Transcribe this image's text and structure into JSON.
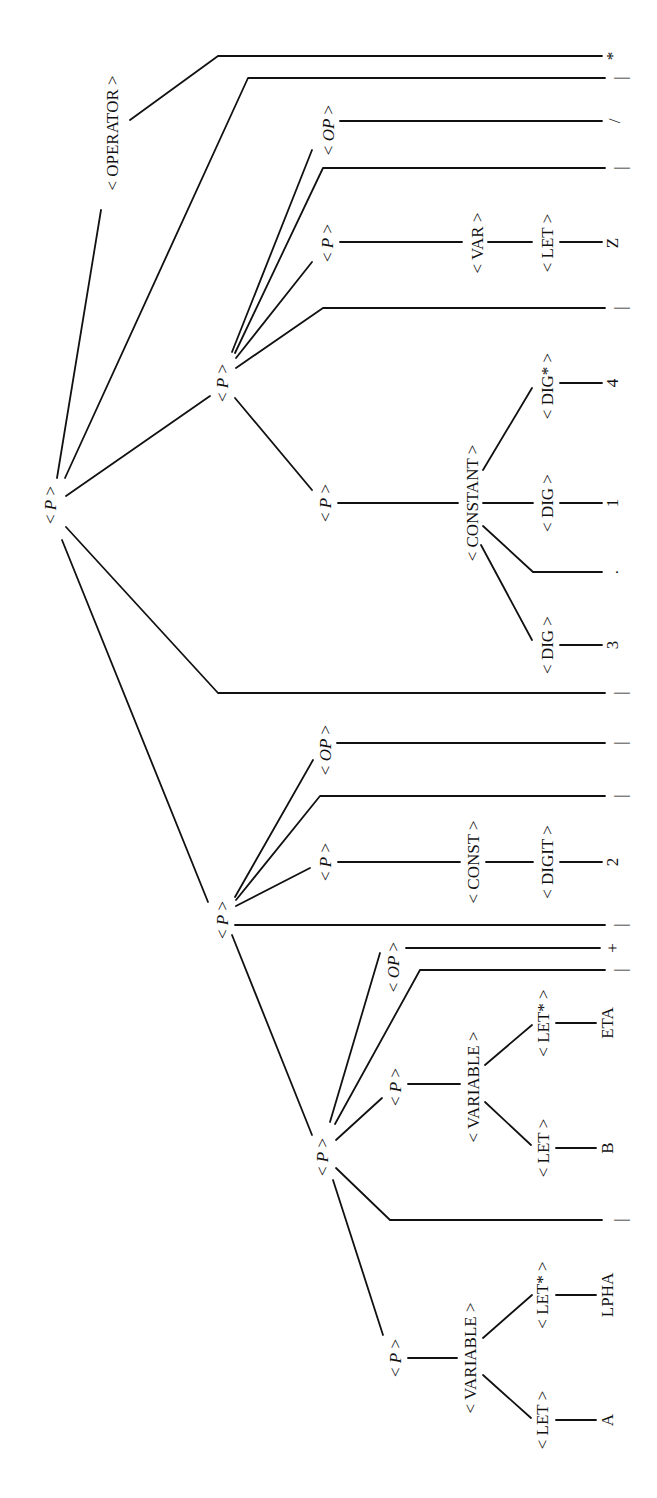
{
  "diagram": {
    "type": "parse-tree",
    "orientation": "rotated-90-ccw",
    "line_color": "#111111",
    "background": "#ffffff",
    "nodes": [
      {
        "id": "root",
        "label": "< P >",
        "italic_P": true,
        "x": 50,
        "y": 505
      },
      {
        "id": "operator",
        "label": "< OPERATOR >",
        "x": 112,
        "y": 133
      },
      {
        "id": "p_upper",
        "label": "< P >",
        "italic_P": true,
        "x": 222,
        "y": 383
      },
      {
        "id": "op_div",
        "label": "< OP >",
        "italic_P": true,
        "x": 328,
        "y": 130
      },
      {
        "id": "p_z",
        "label": "< P >",
        "italic_P": true,
        "x": 327,
        "y": 243
      },
      {
        "id": "var_z",
        "label": "< VAR >",
        "x": 477,
        "y": 243
      },
      {
        "id": "let_z",
        "label": "< LET >",
        "x": 547,
        "y": 243
      },
      {
        "id": "p_const",
        "label": "< P >",
        "italic_P": true,
        "x": 325,
        "y": 503
      },
      {
        "id": "constant",
        "label": "< CONSTANT >",
        "x": 472,
        "y": 503
      },
      {
        "id": "digstar",
        "label": "< DIG* >",
        "x": 547,
        "y": 386
      },
      {
        "id": "dig_1",
        "label": "< DIG >",
        "x": 547,
        "y": 503
      },
      {
        "id": "dig_3",
        "label": "< DIG >",
        "x": 547,
        "y": 645
      },
      {
        "id": "p_mid",
        "label": "< P >",
        "italic_P": true,
        "x": 222,
        "y": 920
      },
      {
        "id": "op_mid",
        "label": "< OP >",
        "italic_P": true,
        "x": 325,
        "y": 750
      },
      {
        "id": "p_2",
        "label": "< P >",
        "italic_P": true,
        "x": 325,
        "y": 862
      },
      {
        "id": "const_2",
        "label": "< CONST >",
        "x": 473,
        "y": 862
      },
      {
        "id": "digit_2",
        "label": "< DIGIT >",
        "x": 547,
        "y": 862
      },
      {
        "id": "p_lower",
        "label": "< P >",
        "italic_P": true,
        "x": 322,
        "y": 1157
      },
      {
        "id": "op_plus",
        "label": "< OP >",
        "italic_P": true,
        "x": 393,
        "y": 967
      },
      {
        "id": "p_b",
        "label": "< P >",
        "italic_P": true,
        "x": 395,
        "y": 1087
      },
      {
        "id": "variable_b",
        "label": "< VARIABLE >",
        "x": 473,
        "y": 1087
      },
      {
        "id": "letstar_b",
        "label": "< LET* >",
        "x": 543,
        "y": 1023
      },
      {
        "id": "let_b",
        "label": "< LET >",
        "x": 543,
        "y": 1148
      },
      {
        "id": "p_a",
        "label": "< P >",
        "italic_P": true,
        "x": 395,
        "y": 1358
      },
      {
        "id": "variable_a",
        "label": "< VARIABLE >",
        "x": 470,
        "y": 1358
      },
      {
        "id": "letstar_a",
        "label": "< LET* >",
        "x": 542,
        "y": 1295
      },
      {
        "id": "let_a",
        "label": "< LET >",
        "x": 542,
        "y": 1420
      }
    ],
    "leaves": [
      {
        "id": "leaf_star",
        "text": "*",
        "x": 612,
        "y": 56
      },
      {
        "id": "leaf_bar1",
        "text": "|",
        "x": 620,
        "y": 78
      },
      {
        "id": "leaf_slash",
        "text": "/",
        "x": 614,
        "y": 121
      },
      {
        "id": "leaf_bar2",
        "text": "|",
        "x": 620,
        "y": 168
      },
      {
        "id": "leaf_z",
        "text": "Z",
        "x": 612,
        "y": 243
      },
      {
        "id": "leaf_bar3",
        "text": "|",
        "x": 620,
        "y": 308
      },
      {
        "id": "leaf_4",
        "text": "4",
        "x": 612,
        "y": 383
      },
      {
        "id": "leaf_1",
        "text": "1",
        "x": 612,
        "y": 503
      },
      {
        "id": "leaf_dot",
        "text": ".",
        "x": 612,
        "y": 572
      },
      {
        "id": "leaf_3",
        "text": "3",
        "x": 612,
        "y": 645
      },
      {
        "id": "leaf_bar4",
        "text": "|",
        "x": 620,
        "y": 693
      },
      {
        "id": "leaf_bar5",
        "text": "|",
        "x": 620,
        "y": 743
      },
      {
        "id": "leaf_bar6",
        "text": "|",
        "x": 620,
        "y": 796
      },
      {
        "id": "leaf_2",
        "text": "2",
        "x": 612,
        "y": 862
      },
      {
        "id": "leaf_bar7",
        "text": "|",
        "x": 620,
        "y": 925
      },
      {
        "id": "leaf_plus",
        "text": "+",
        "x": 612,
        "y": 948
      },
      {
        "id": "leaf_bar8",
        "text": "|",
        "x": 620,
        "y": 970
      },
      {
        "id": "leaf_eta",
        "text": "ETA",
        "x": 607,
        "y": 1023
      },
      {
        "id": "leaf_b",
        "text": "B",
        "x": 607,
        "y": 1148
      },
      {
        "id": "leaf_bar9",
        "text": "|",
        "x": 620,
        "y": 1220
      },
      {
        "id": "leaf_lpha",
        "text": "LPHA",
        "x": 607,
        "y": 1295
      },
      {
        "id": "leaf_a",
        "text": "A",
        "x": 607,
        "y": 1420
      }
    ]
  }
}
